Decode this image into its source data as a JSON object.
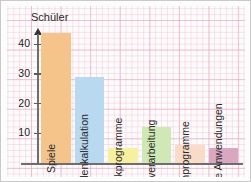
{
  "chart_data": {
    "type": "bar",
    "title": "",
    "subtitle": "",
    "xlabel": "",
    "ylabel": "Schüler",
    "ylim": [
      0,
      46
    ],
    "yticks": [
      10,
      20,
      30,
      40
    ],
    "grid": true,
    "legend": "none",
    "orientation": "vertical",
    "label_placement": "rotated-inside-bar",
    "categories": [
      "Spiele",
      "Tabellenkalkulation",
      "Grafikprogramme",
      "Textverarbeitung",
      "Lernprogramme",
      "Sonstige Anwendungen"
    ],
    "values": [
      44,
      29,
      5,
      12,
      6,
      5
    ],
    "colors": [
      "#F5C48A",
      "#B8D9F0",
      "#F7F0A0",
      "#CFE8B5",
      "#F8DCC8",
      "#D9A8C0"
    ],
    "bars": [
      {
        "label": "Spiele",
        "value": 44,
        "color": "#F5C48A"
      },
      {
        "label": "Tabellenkalkulation",
        "value": 29,
        "color": "#B8D9F0"
      },
      {
        "label": "Grafikprogramme",
        "value": 5,
        "color": "#F7F0A0"
      },
      {
        "label": "Textverarbeitung",
        "value": 12,
        "color": "#CFE8B5"
      },
      {
        "label": "Lernprogramme",
        "value": 6,
        "color": "#F8DCC8"
      },
      {
        "label": "Sonstige Anwendungen",
        "value": 5,
        "color": "#D9A8C0"
      }
    ]
  },
  "axis": {
    "y_label": "Schüler",
    "y_tick_labels": [
      "40",
      "30",
      "20",
      "10"
    ]
  },
  "style": {
    "grid_color": "#e5a6ba",
    "axis_color": "#6e6e6e",
    "paper_color": "#fefbfc",
    "frame_color": "#c9c9c9",
    "text_color": "#2a2a2a"
  }
}
